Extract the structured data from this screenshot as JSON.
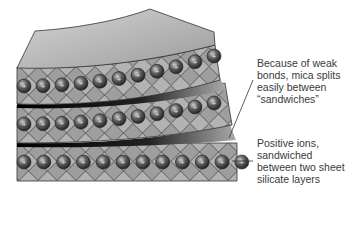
{
  "diagram": {
    "ion_symbol": "+",
    "labels": {
      "weak_bonds": "Because of weak bonds, mica splits easily between “sandwiches”",
      "positive_ions": "Positive ions, sandwiched between two sheet silicate layers"
    },
    "colors": {
      "sheet_top": "#b8b8b8",
      "tetra_fill": "#9a9a9a",
      "outline": "#333333",
      "ion": "#555555",
      "split_dark": "#111111"
    }
  }
}
